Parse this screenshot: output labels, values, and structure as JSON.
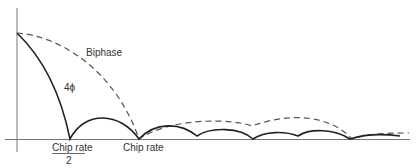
{
  "diagram": {
    "type": "spectrum-comparison",
    "curves": [
      {
        "name": "Biphase",
        "style": "dashed",
        "label": "Biphase"
      },
      {
        "name": "4phi",
        "style": "solid",
        "label": "4ϕ"
      }
    ],
    "x_labels": {
      "half_chip_rate_numerator": "Chip rate",
      "half_chip_rate_denominator": "2",
      "chip_rate": "Chip rate"
    }
  }
}
